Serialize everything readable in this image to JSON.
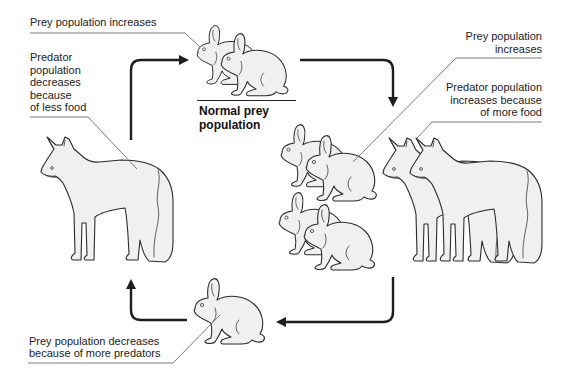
{
  "diagram": {
    "labels": {
      "top_prey_increases": "Prey population increases",
      "predator_decreases": [
        "Predator",
        "population",
        "decreases",
        "because",
        "of less food"
      ],
      "normal_prey": [
        "Normal prey",
        "population"
      ],
      "right_prey_increases": [
        "Prey population",
        "increases"
      ],
      "predator_increases": [
        "Predator population",
        "increases because",
        "of more food"
      ],
      "prey_decreases": [
        "Prey population decreases",
        "because of more predators"
      ]
    },
    "figures": [
      {
        "name": "rabbit-pair-top",
        "animal": "rabbit",
        "count": 2
      },
      {
        "name": "fox-left",
        "animal": "fox",
        "count": 1
      },
      {
        "name": "rabbit-group-right",
        "animal": "rabbit",
        "count": 4
      },
      {
        "name": "fox-pair-right",
        "animal": "fox",
        "count": 2
      },
      {
        "name": "rabbit-single-bottom",
        "animal": "rabbit",
        "count": 1
      }
    ],
    "cycle_arrows": [
      "top-left-up-right",
      "top-right-right-down",
      "bottom-right-down-left",
      "bottom-left-left-up"
    ],
    "colors": {
      "background": "#ffffff",
      "animal_fill": "#f0f0f0",
      "outline": "#2b2b2b",
      "arrow": "#1e1e1e",
      "leader_line": "#5a5a5a",
      "text": "#222222"
    }
  }
}
